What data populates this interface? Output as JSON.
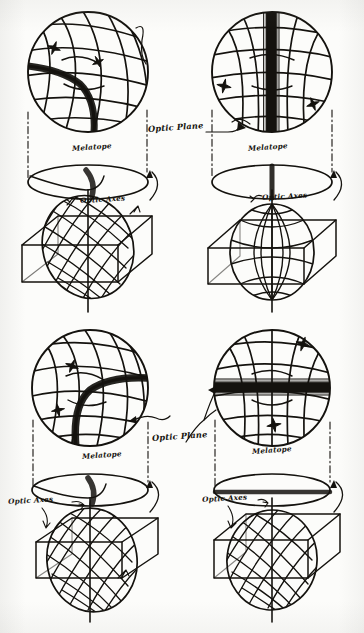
{
  "figure": {
    "medium": "hand-drawn ink diagram",
    "background_color": "#fcfcfa",
    "ink_color": "#14120e",
    "panel_count": 4
  },
  "labels": {
    "melatope": "Melatope",
    "optic_plane": "Optic Plane",
    "optic_axes": "Optic Axes"
  },
  "panels": [
    {
      "id": "top-left",
      "position": "top-left",
      "sphere": {
        "name": "interference-figure-sphere",
        "isogyre": "curved-brush",
        "isogyre_orientation": "oblique-curve",
        "cross_marks": 2,
        "net": "stereographic"
      },
      "ellipse": {
        "name": "optic-plane-ellipse",
        "trace": "curved"
      },
      "globe": {
        "name": "indicatrix-globe",
        "tilt": "inclined"
      },
      "box": {
        "name": "crystal-section-box"
      },
      "labels_shown": [
        "Melatope",
        "Optic Axes"
      ],
      "rotation_arrow": true
    },
    {
      "id": "top-right",
      "position": "top-right",
      "sphere": {
        "name": "interference-figure-sphere",
        "isogyre": "straight-bar",
        "isogyre_orientation": "vertical",
        "cross_marks": 2,
        "net": "stereographic"
      },
      "ellipse": {
        "name": "optic-plane-ellipse",
        "trace": "vertical"
      },
      "globe": {
        "name": "indicatrix-globe",
        "tilt": "upright"
      },
      "box": {
        "name": "crystal-section-box"
      },
      "labels_shown": [
        "Optic Plane",
        "Melatope",
        "Optic Axes"
      ],
      "rotation_arrow": true
    },
    {
      "id": "bottom-left",
      "position": "bottom-left",
      "sphere": {
        "name": "interference-figure-sphere",
        "isogyre": "curved-brush",
        "isogyre_orientation": "oblique-curve",
        "cross_marks": 2,
        "net": "stereographic"
      },
      "ellipse": {
        "name": "optic-plane-ellipse",
        "trace": "curved"
      },
      "globe": {
        "name": "indicatrix-globe",
        "tilt": "inclined"
      },
      "box": {
        "name": "crystal-section-box"
      },
      "labels_shown": [
        "Melatope",
        "Optic Axes",
        "Optic Plane"
      ],
      "rotation_arrow": true
    },
    {
      "id": "bottom-right",
      "position": "bottom-right",
      "sphere": {
        "name": "interference-figure-sphere",
        "isogyre": "straight-bar",
        "isogyre_orientation": "horizontal",
        "cross_marks": 2,
        "net": "stereographic"
      },
      "ellipse": {
        "name": "optic-plane-ellipse",
        "trace": "horizontal"
      },
      "globe": {
        "name": "indicatrix-globe",
        "tilt": "upright"
      },
      "box": {
        "name": "crystal-section-box"
      },
      "labels_shown": [
        "Melatope",
        "Optic Axes"
      ],
      "rotation_arrow": true
    }
  ],
  "label_placements": [
    {
      "key": "melatope",
      "text": "Melatope",
      "x": 72,
      "y": 148,
      "rot": -4
    },
    {
      "key": "optic_axes",
      "text": "Optic Axes",
      "x": 80,
      "y": 201,
      "rot": -3
    },
    {
      "key": "optic_plane",
      "text": "Optic Plane",
      "x": 150,
      "y": 129,
      "rot": -4
    },
    {
      "key": "melatope",
      "text": "Melatope",
      "x": 250,
      "y": 148,
      "rot": -4
    },
    {
      "key": "optic_axes",
      "text": "Optic Axes",
      "x": 262,
      "y": 198,
      "rot": -3
    },
    {
      "key": "melatope",
      "text": "Melatope",
      "x": 85,
      "y": 455,
      "rot": -4
    },
    {
      "key": "optic_axes",
      "text": "Optic Axes",
      "x": 11,
      "y": 500,
      "rot": -3
    },
    {
      "key": "optic_plane",
      "text": "Optic Plane",
      "x": 155,
      "y": 437,
      "rot": -4
    },
    {
      "key": "melatope",
      "text": "Melatope",
      "x": 255,
      "y": 450,
      "rot": -4
    },
    {
      "key": "optic_axes",
      "text": "Optic Axes",
      "x": 205,
      "y": 498,
      "rot": -3
    }
  ]
}
